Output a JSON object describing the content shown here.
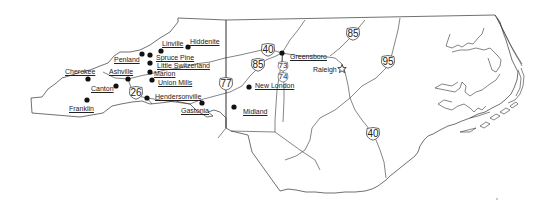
{
  "map": {
    "title": "North Carolina",
    "line_color": "#333333",
    "dot_color": "#111111",
    "background": "#ffffff"
  },
  "cities": [
    {
      "name": "Hiddenite",
      "dot": [
        188,
        47
      ],
      "label": [
        190,
        38
      ]
    },
    {
      "name": "Linville",
      "dot": [
        161,
        51
      ],
      "label": [
        162,
        40
      ]
    },
    {
      "name": "Penland",
      "dot": [
        142,
        54
      ],
      "label": [
        114,
        56
      ]
    },
    {
      "name": "Spruce Pine",
      "dot": [
        150,
        55
      ],
      "label": [
        156,
        54
      ]
    },
    {
      "name": "Little Switzerland",
      "dot": [
        150,
        63
      ],
      "label": [
        157,
        62
      ]
    },
    {
      "name": "Marion",
      "dot": [
        150,
        72
      ],
      "label": [
        154,
        70
      ]
    },
    {
      "name": "Ashville",
      "dot": [
        128,
        79
      ],
      "label": [
        109,
        68
      ]
    },
    {
      "name": "Union Mills",
      "dot": [
        152,
        80
      ],
      "label": [
        158,
        79
      ]
    },
    {
      "name": "Cherokee",
      "dot": [
        88,
        79
      ],
      "label": [
        65,
        68
      ]
    },
    {
      "name": "Canton",
      "dot": [
        116,
        86
      ],
      "label": [
        91,
        85
      ]
    },
    {
      "name": "Franklin",
      "dot": [
        87,
        100
      ],
      "label": [
        69,
        105
      ]
    },
    {
      "name": "Hendersonville",
      "dot": [
        147,
        98
      ],
      "label": [
        155,
        93
      ]
    },
    {
      "name": "Gastonia",
      "dot": [
        202,
        103
      ],
      "label": [
        181,
        107
      ]
    },
    {
      "name": "Midland",
      "dot": [
        234,
        107
      ],
      "label": [
        243,
        108
      ]
    },
    {
      "name": "New London",
      "dot": [
        249,
        87
      ],
      "label": [
        255,
        82
      ]
    },
    {
      "name": "Greensboro",
      "dot": [
        282,
        53
      ],
      "label": [
        290,
        53
      ]
    }
  ],
  "capital": {
    "name": "Raleigh",
    "star": [
      342,
      69
    ],
    "label": [
      313,
      66
    ]
  },
  "highways": [
    {
      "number": "40",
      "pos": [
        260,
        43
      ],
      "size": "large"
    },
    {
      "number": "85",
      "pos": [
        250,
        58
      ],
      "size": "large"
    },
    {
      "number": "77",
      "pos": [
        218,
        77
      ],
      "size": "large"
    },
    {
      "number": "26",
      "pos": [
        128,
        86
      ],
      "size": "large"
    },
    {
      "number": "73",
      "pos": [
        277,
        61
      ],
      "size": "small"
    },
    {
      "number": "74",
      "pos": [
        277,
        72
      ],
      "size": "small"
    },
    {
      "number": "85",
      "pos": [
        345,
        27
      ],
      "size": "large"
    },
    {
      "number": "95",
      "pos": [
        380,
        55
      ],
      "size": "large"
    },
    {
      "number": "40",
      "pos": [
        365,
        127
      ],
      "size": "large"
    }
  ]
}
